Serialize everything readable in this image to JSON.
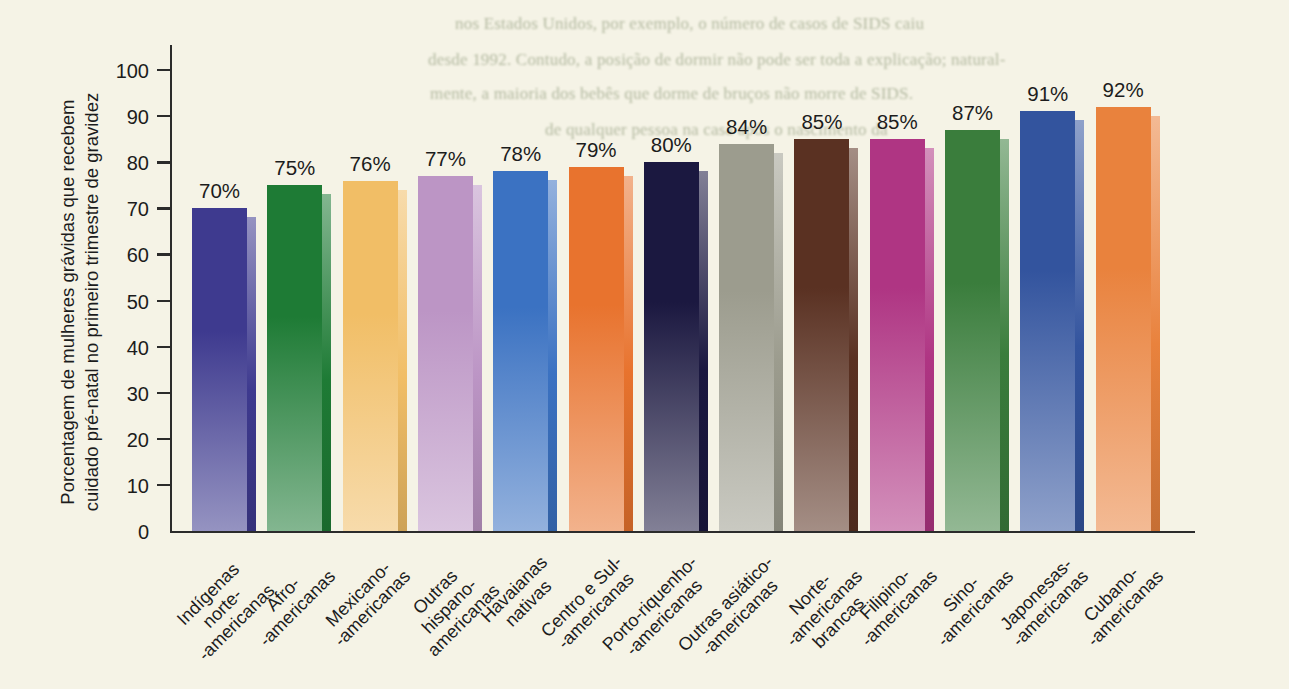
{
  "figure": {
    "ghost_text_lines": [
      {
        "text": "nos Estados Unidos, por exemplo, o número de casos de SIDS caiu",
        "x": 455,
        "y": 14
      },
      {
        "text": "desde 1992. Contudo, a posição de dormir não pode ser toda a explicação; natural-",
        "x": 428,
        "y": 50
      },
      {
        "text": "mente, a maioria dos bebês que dorme de bruços não morre de SIDS.",
        "x": 430,
        "y": 84
      },
      {
        "text": "de qualquer pessoa na casa após o nascimento da",
        "x": 545,
        "y": 120
      }
    ]
  },
  "chart_data": {
    "type": "bar",
    "title": "",
    "ylabel_lines": [
      "Porcentagem de mulheres grávidas que recebem",
      "cuidado pré-natal no primeiro trimestre de gravidez"
    ],
    "ylabel": "Porcentagem de mulheres grávidas que recebem cuidado pré-natal no primeiro trimestre de gravidez",
    "xlabel": "",
    "ylim": [
      0,
      100
    ],
    "yticks": [
      0,
      10,
      20,
      30,
      40,
      50,
      60,
      70,
      80,
      90,
      100
    ],
    "grid": "off",
    "legend": "none",
    "categories": [
      "Indígenas norte-americanas",
      "Afro-americanas",
      "Mexicano-americanas",
      "Outras hispano-americanas",
      "Havaianas nativas",
      "Centro e Sul-americanas",
      "Porto-riquenho-americanas",
      "Outras asiático-americanas",
      "Norte-americanas brancas",
      "Filipino-americanas",
      "Sino-americanas",
      "Japonesas-americanas",
      "Cubano-americanas"
    ],
    "category_lines": [
      [
        "Indígenas",
        "norte-",
        "-americanas"
      ],
      [
        "Afro-",
        "-americanas"
      ],
      [
        "Mexicano-",
        "-americanas"
      ],
      [
        "Outras",
        "hispano-",
        "americanas"
      ],
      [
        "Havaianas",
        "nativas"
      ],
      [
        "Centro e Sul-",
        "-americanas"
      ],
      [
        "Porto-riquenho-",
        "-americanas"
      ],
      [
        "Outras asiático-",
        "-americanas"
      ],
      [
        "Norte-",
        "-americanas",
        "brancas"
      ],
      [
        "Filipino-",
        "-americanas"
      ],
      [
        "Sino-",
        "-americanas"
      ],
      [
        "Japonesas-",
        "-americanas"
      ],
      [
        "Cubano-",
        "-americanas"
      ]
    ],
    "values": [
      70,
      75,
      76,
      77,
      78,
      79,
      80,
      84,
      85,
      85,
      87,
      91,
      92
    ],
    "value_labels": [
      "70%",
      "75%",
      "76%",
      "77%",
      "78%",
      "79%",
      "80%",
      "84%",
      "85%",
      "85%",
      "87%",
      "91%",
      "92%"
    ],
    "bar_colors": [
      "#3E3A8F",
      "#1E7B35",
      "#F1BE66",
      "#BC95C5",
      "#3B72C2",
      "#E8732E",
      "#1B1840",
      "#9C9C8E",
      "#5A3122",
      "#AF3583",
      "#3A7D3C",
      "#33549E",
      "#E9823D"
    ],
    "background_color": "#F5F3E6",
    "axis_color": "#2B2B2B",
    "text_color": "#1C1C1C",
    "ghost_text_color": "#7D8A68"
  }
}
